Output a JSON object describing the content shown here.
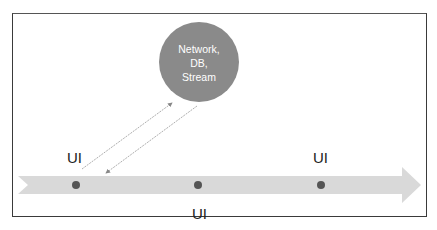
{
  "diagram": {
    "server_node": {
      "lines": [
        "Network,",
        "DB,",
        "Stream"
      ],
      "fill": "#8a8a8a"
    },
    "labels": {
      "ui_left": "UI",
      "ui_middle": "UI",
      "ui_right": "UI"
    },
    "timeline": {
      "fill": "#d9d9d9",
      "dot_color": "#555555",
      "dots": 3
    },
    "colors": {
      "border": "#3a3a3a",
      "arrow_line": "#9a9a9a"
    }
  }
}
